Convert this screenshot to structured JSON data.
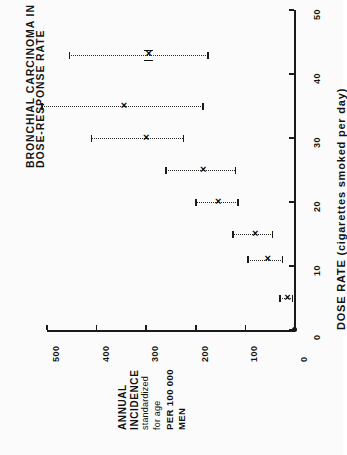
{
  "figure": {
    "title_line1": "DOSE-RESPONSE RATE",
    "title_line2": "BRONCHIAL CARCINOMA IN CIGARETTE SMOKERS"
  },
  "axes": {
    "x_title": "DOSE RATE  (cigarettes smoked per day)",
    "x_ticks": [
      "0",
      "10",
      "20",
      "30",
      "40",
      "50"
    ],
    "y_ticks": [
      "500",
      "400",
      "300",
      "200",
      "100",
      "0"
    ],
    "y_label_lines": [
      "ANNUAL",
      "INCIDENCE",
      "standardized",
      "for age",
      "PER  100 000",
      "MEN"
    ]
  },
  "chart_data": {
    "type": "scatter",
    "orientation": "rotated-90-ccw",
    "xlabel": "DOSE RATE (cigarettes smoked per day)",
    "ylabel": "ANNUAL INCIDENCE standardized for age PER 100 000 MEN",
    "xlim": [
      0,
      50
    ],
    "ylim": [
      0,
      500
    ],
    "xticks": [
      0,
      10,
      20,
      30,
      40,
      50
    ],
    "yticks": [
      0,
      100,
      200,
      300,
      400,
      500
    ],
    "grid": false,
    "legend": "none",
    "x": [
      5,
      11,
      15,
      20,
      25,
      30,
      35,
      43
    ],
    "values": [
      15,
      55,
      80,
      155,
      185,
      300,
      345,
      295
    ],
    "y_err_low": [
      5,
      25,
      45,
      115,
      120,
      225,
      185,
      175
    ],
    "y_err_high": [
      30,
      95,
      125,
      200,
      260,
      410,
      510,
      455
    ],
    "points": [
      {
        "dose": 5,
        "incidence": 15,
        "ci_low": 5,
        "ci_high": 30,
        "bracketed": false
      },
      {
        "dose": 11,
        "incidence": 55,
        "ci_low": 25,
        "ci_high": 95,
        "bracketed": false
      },
      {
        "dose": 15,
        "incidence": 80,
        "ci_low": 45,
        "ci_high": 125,
        "bracketed": false
      },
      {
        "dose": 20,
        "incidence": 155,
        "ci_low": 115,
        "ci_high": 200,
        "bracketed": false
      },
      {
        "dose": 25,
        "incidence": 185,
        "ci_low": 120,
        "ci_high": 260,
        "bracketed": false
      },
      {
        "dose": 30,
        "incidence": 300,
        "ci_low": 225,
        "ci_high": 410,
        "bracketed": false
      },
      {
        "dose": 35,
        "incidence": 345,
        "ci_low": 185,
        "ci_high": 510,
        "bracketed": false
      },
      {
        "dose": 43,
        "incidence": 295,
        "ci_low": 175,
        "ci_high": 455,
        "bracketed": true
      }
    ]
  }
}
